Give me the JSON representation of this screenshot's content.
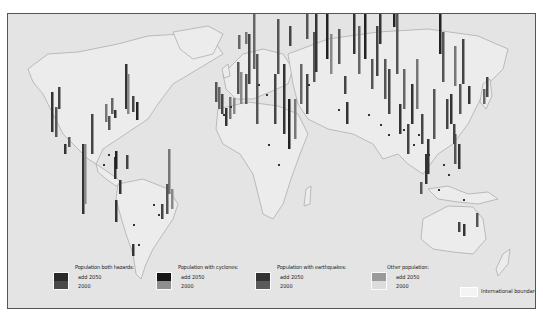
{
  "map": {
    "background": "#e4e4e4",
    "land_fill": "#ececec",
    "coast_stroke": "#9a9a9a",
    "frame_border": "#555555"
  },
  "legend": {
    "groups": [
      {
        "title": "Population both hazards:",
        "label_top": "add 2050",
        "label_bottom": "2000",
        "color_top": "#2a2a2a",
        "color_bottom": "#4a4a4a"
      },
      {
        "title": "Population with cyclones:",
        "label_top": "add 2050",
        "label_bottom": "2000",
        "color_top": "#151515",
        "color_bottom": "#8e8e8e"
      },
      {
        "title": "Population with earthquakes:",
        "label_top": "add 2050",
        "label_bottom": "2000",
        "color_top": "#333333",
        "color_bottom": "#5a5a5a"
      },
      {
        "title": "Other population:",
        "label_top": "add 2050",
        "label_bottom": "2000",
        "color_top": "#9a9a9a",
        "color_bottom": "#dcdcdc"
      }
    ],
    "boundary_label": "International boundaries"
  },
  "bars": [
    {
      "x": 43,
      "y": 118,
      "h": 40,
      "c": "#333"
    },
    {
      "x": 47,
      "y": 123,
      "h": 30,
      "c": "#555"
    },
    {
      "x": 50,
      "y": 95,
      "h": 22,
      "c": "#444"
    },
    {
      "x": 56,
      "y": 140,
      "h": 10,
      "c": "#333"
    },
    {
      "x": 60,
      "y": 133,
      "h": 10,
      "c": "#555"
    },
    {
      "x": 74,
      "y": 200,
      "h": 70,
      "c": "#333"
    },
    {
      "x": 76,
      "y": 190,
      "h": 60,
      "c": "#888"
    },
    {
      "x": 83,
      "y": 140,
      "h": 40,
      "c": "#444"
    },
    {
      "x": 97,
      "y": 108,
      "h": 18,
      "c": "#777"
    },
    {
      "x": 100,
      "y": 116,
      "h": 14,
      "c": "#555"
    },
    {
      "x": 103,
      "y": 100,
      "h": 16,
      "c": "#666"
    },
    {
      "x": 106,
      "y": 104,
      "h": 8,
      "c": "#333"
    },
    {
      "x": 117,
      "y": 95,
      "h": 45,
      "c": "#333"
    },
    {
      "x": 119,
      "y": 100,
      "h": 40,
      "c": "#888"
    },
    {
      "x": 124,
      "y": 98,
      "h": 16,
      "c": "#444"
    },
    {
      "x": 128,
      "y": 106,
      "h": 18,
      "c": "#222"
    },
    {
      "x": 106,
      "y": 165,
      "h": 22,
      "c": "#333"
    },
    {
      "x": 107,
      "y": 155,
      "h": 18,
      "c": "#222"
    },
    {
      "x": 118,
      "y": 155,
      "h": 14,
      "c": "#444"
    },
    {
      "x": 111,
      "y": 180,
      "h": 14,
      "c": "#333"
    },
    {
      "x": 107,
      "y": 208,
      "h": 22,
      "c": "#333"
    },
    {
      "x": 160,
      "y": 180,
      "h": 45,
      "c": "#777"
    },
    {
      "x": 158,
      "y": 200,
      "h": 30,
      "c": "#555"
    },
    {
      "x": 163,
      "y": 195,
      "h": 20,
      "c": "#888"
    },
    {
      "x": 153,
      "y": 205,
      "h": 15,
      "c": "#444"
    },
    {
      "x": 124,
      "y": 242,
      "h": 12,
      "c": "#333"
    },
    {
      "x": 207,
      "y": 88,
      "h": 20,
      "c": "#555"
    },
    {
      "x": 210,
      "y": 95,
      "h": 22,
      "c": "#666"
    },
    {
      "x": 213,
      "y": 100,
      "h": 20,
      "c": "#444"
    },
    {
      "x": 217,
      "y": 112,
      "h": 18,
      "c": "#333"
    },
    {
      "x": 221,
      "y": 105,
      "h": 22,
      "c": "#777"
    },
    {
      "x": 225,
      "y": 100,
      "h": 16,
      "c": "#888"
    },
    {
      "x": 229,
      "y": 80,
      "h": 32,
      "c": "#555"
    },
    {
      "x": 232,
      "y": 90,
      "h": 32,
      "c": "#888"
    },
    {
      "x": 237,
      "y": 90,
      "h": 30,
      "c": "#555"
    },
    {
      "x": 240,
      "y": 70,
      "h": 50,
      "c": "#444"
    },
    {
      "x": 245,
      "y": 55,
      "h": 60,
      "c": "#666"
    },
    {
      "x": 248,
      "y": 110,
      "h": 70,
      "c": "#555"
    },
    {
      "x": 266,
      "y": 110,
      "h": 50,
      "c": "#444"
    },
    {
      "x": 269,
      "y": 60,
      "h": 55,
      "c": "#555"
    },
    {
      "x": 275,
      "y": 120,
      "h": 70,
      "c": "#333"
    },
    {
      "x": 280,
      "y": 135,
      "h": 50,
      "c": "#222"
    },
    {
      "x": 286,
      "y": 125,
      "h": 40,
      "c": "#777"
    },
    {
      "x": 292,
      "y": 90,
      "h": 40,
      "c": "#666"
    },
    {
      "x": 298,
      "y": 100,
      "h": 40,
      "c": "#444"
    },
    {
      "x": 305,
      "y": 68,
      "h": 50,
      "c": "#555"
    },
    {
      "x": 307,
      "y": 58,
      "h": 60,
      "c": "#333"
    },
    {
      "x": 318,
      "y": 45,
      "h": 60,
      "c": "#222"
    },
    {
      "x": 322,
      "y": 60,
      "h": 40,
      "c": "#888"
    },
    {
      "x": 330,
      "y": 50,
      "h": 35,
      "c": "#555"
    },
    {
      "x": 336,
      "y": 80,
      "h": 18,
      "c": "#444"
    },
    {
      "x": 230,
      "y": 35,
      "h": 14,
      "c": "#666"
    },
    {
      "x": 237,
      "y": 30,
      "h": 12,
      "c": "#777"
    },
    {
      "x": 281,
      "y": 32,
      "h": 20,
      "c": "#444"
    },
    {
      "x": 298,
      "y": 25,
      "h": 25,
      "c": "#555"
    },
    {
      "x": 338,
      "y": 110,
      "h": 22,
      "c": "#333"
    },
    {
      "x": 345,
      "y": 40,
      "h": 70,
      "c": "#333"
    },
    {
      "x": 350,
      "y": 60,
      "h": 48,
      "c": "#666"
    },
    {
      "x": 356,
      "y": 45,
      "h": 70,
      "c": "#222"
    },
    {
      "x": 363,
      "y": 75,
      "h": 30,
      "c": "#555"
    },
    {
      "x": 368,
      "y": 62,
      "h": 50,
      "c": "#444"
    },
    {
      "x": 371,
      "y": 30,
      "h": 90,
      "c": "#333"
    },
    {
      "x": 376,
      "y": 85,
      "h": 40,
      "c": "#555"
    },
    {
      "x": 380,
      "y": 100,
      "h": 45,
      "c": "#444"
    },
    {
      "x": 385,
      "y": 13,
      "h": 115,
      "c": "#222"
    },
    {
      "x": 388,
      "y": 60,
      "h": 60,
      "c": "#555"
    },
    {
      "x": 391,
      "y": 120,
      "h": 30,
      "c": "#333"
    },
    {
      "x": 395,
      "y": 95,
      "h": 40,
      "c": "#666"
    },
    {
      "x": 399,
      "y": 140,
      "h": 30,
      "c": "#444"
    },
    {
      "x": 403,
      "y": 110,
      "h": 40,
      "c": "#333"
    },
    {
      "x": 408,
      "y": 95,
      "h": 50,
      "c": "#777"
    },
    {
      "x": 413,
      "y": 130,
      "h": 30,
      "c": "#444"
    },
    {
      "x": 419,
      "y": 160,
      "h": 35,
      "c": "#333"
    },
    {
      "x": 425,
      "y": 125,
      "h": 50,
      "c": "#555"
    },
    {
      "x": 431,
      "y": 40,
      "h": 80,
      "c": "#222"
    },
    {
      "x": 434,
      "y": 68,
      "h": 50,
      "c": "#555"
    },
    {
      "x": 438,
      "y": 115,
      "h": 30,
      "c": "#444"
    },
    {
      "x": 442,
      "y": 110,
      "h": 30,
      "c": "#333"
    },
    {
      "x": 446,
      "y": 72,
      "h": 40,
      "c": "#777"
    },
    {
      "x": 451,
      "y": 100,
      "h": 30,
      "c": "#555"
    },
    {
      "x": 454,
      "y": 70,
      "h": 45,
      "c": "#444"
    },
    {
      "x": 460,
      "y": 90,
      "h": 18,
      "c": "#333"
    },
    {
      "x": 446,
      "y": 150,
      "h": 30,
      "c": "#555"
    },
    {
      "x": 450,
      "y": 155,
      "h": 25,
      "c": "#333"
    },
    {
      "x": 445,
      "y": 130,
      "h": 20,
      "c": "#444"
    },
    {
      "x": 475,
      "y": 90,
      "h": 15,
      "c": "#666"
    },
    {
      "x": 478,
      "y": 83,
      "h": 20,
      "c": "#444"
    },
    {
      "x": 417,
      "y": 170,
      "h": 30,
      "c": "#333"
    },
    {
      "x": 412,
      "y": 180,
      "h": 12,
      "c": "#555"
    },
    {
      "x": 450,
      "y": 218,
      "h": 10,
      "c": "#444"
    },
    {
      "x": 455,
      "y": 222,
      "h": 12,
      "c": "#333"
    },
    {
      "x": 468,
      "y": 213,
      "h": 14,
      "c": "#555"
    }
  ]
}
